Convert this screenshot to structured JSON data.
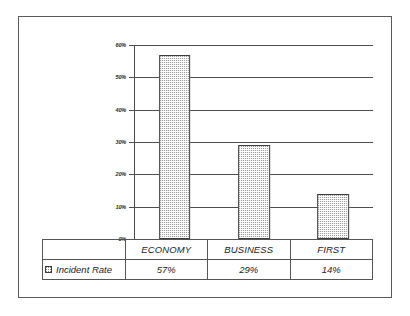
{
  "chart_data": {
    "type": "bar",
    "title": "",
    "subtitle": "",
    "xlabel": "",
    "ylabel": "",
    "categories": [
      "ECONOMY",
      "BUSINESS",
      "FIRST"
    ],
    "series": [
      {
        "name": "Incident Rate",
        "values": [
          57,
          29,
          14
        ],
        "value_labels": [
          "57%",
          "29%",
          "14%"
        ]
      }
    ],
    "ylim": [
      0,
      60
    ],
    "ytick_values": [
      0,
      10,
      20,
      30,
      40,
      50,
      60
    ],
    "ytick_labels": [
      "0%",
      "10%",
      "20%",
      "30%",
      "40%",
      "50%",
      "60%"
    ],
    "grid": true,
    "legend_position": "data-table-row",
    "annotations": []
  },
  "table": {
    "corner_label": "",
    "category_headers": [
      "ECONOMY",
      "BUSINESS",
      "FIRST"
    ],
    "rows": [
      {
        "series_label": "Incident Rate",
        "swatch_icon": "legend-swatch-dotted",
        "cells": [
          "57%",
          "29%",
          "14%"
        ]
      }
    ]
  }
}
